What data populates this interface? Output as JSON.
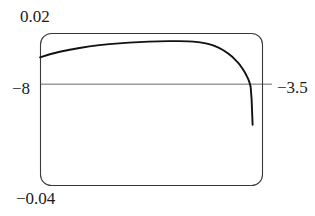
{
  "figure": {
    "type": "plot",
    "background_color": "#ffffff",
    "frame_color": "#3a3a3a",
    "curve_color": "#111111",
    "axis_line_color": "#6b6b6b",
    "label_color": "#1a1a1a"
  },
  "labels": {
    "y_max": "0.02",
    "y_min": "−0.04",
    "x_min": "−8",
    "x_max": "−3.5"
  },
  "chart_data": {
    "type": "line",
    "title": "",
    "xlabel": "",
    "ylabel": "",
    "xlim": [
      -8,
      -3.5
    ],
    "ylim": [
      -0.04,
      0.02
    ],
    "grid": false,
    "legend": null,
    "axhline": 0,
    "frame": "rounded-box",
    "series": [
      {
        "name": "curve",
        "x": [
          -8.0,
          -7.8,
          -7.6,
          -7.4,
          -7.2,
          -7.0,
          -6.8,
          -6.6,
          -6.4,
          -6.2,
          -6.0,
          -5.8,
          -5.6,
          -5.4,
          -5.2,
          -5.0,
          -4.9,
          -4.8,
          -4.7,
          -4.6,
          -4.5,
          -4.4,
          -4.3,
          -4.2,
          -4.1,
          -4.0,
          -3.95,
          -3.9,
          -3.85,
          -3.8,
          -3.78,
          -3.76,
          -3.74,
          -3.72,
          -3.7
        ],
        "y": [
          0.0106,
          0.0118,
          0.0128,
          0.0136,
          0.0143,
          0.0149,
          0.0154,
          0.0158,
          0.0161,
          0.0164,
          0.0166,
          0.0168,
          0.0169,
          0.017,
          0.017,
          0.0169,
          0.0168,
          0.0166,
          0.0163,
          0.0159,
          0.0153,
          0.0145,
          0.0135,
          0.0122,
          0.0106,
          0.0086,
          0.0074,
          0.006,
          0.0044,
          0.0025,
          0.0016,
          0.0005,
          -0.001,
          -0.006,
          -0.016
        ]
      }
    ],
    "tick_labels": {
      "x": [
        "−8",
        "−3.5"
      ],
      "y": [
        "−0.04",
        "0.02"
      ]
    }
  }
}
